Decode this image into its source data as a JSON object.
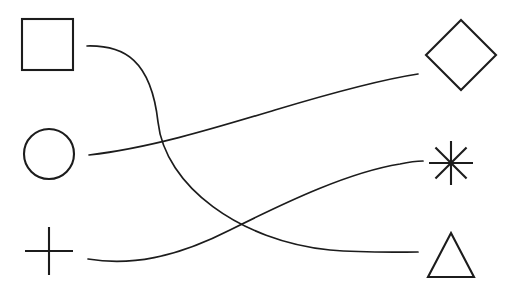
{
  "canvas": {
    "width": 515,
    "height": 287,
    "background_color": "#ffffff",
    "stroke_color": "#1c1c1c",
    "title": "Shape matching diagram"
  },
  "left_column": {
    "label": "left-shapes",
    "items": [
      {
        "id": "square",
        "name": "square",
        "icon": "square-icon",
        "center": [
          48,
          45
        ],
        "size": 51,
        "bbox": [
          22,
          19,
          51,
          51
        ]
      },
      {
        "id": "circle",
        "name": "circle",
        "icon": "circle-icon",
        "center": [
          49,
          154
        ],
        "radius": 25,
        "bbox": [
          24,
          129,
          50,
          50
        ]
      },
      {
        "id": "plus",
        "name": "plus",
        "icon": "plus-icon",
        "center": [
          49,
          251
        ],
        "arm": 24,
        "bbox": [
          25,
          227,
          48,
          48
        ]
      }
    ]
  },
  "right_column": {
    "label": "right-shapes",
    "items": [
      {
        "id": "diamond",
        "name": "diamond",
        "icon": "diamond-icon",
        "center": [
          461,
          55
        ],
        "radius": 35,
        "bbox": [
          426,
          20,
          70,
          70
        ]
      },
      {
        "id": "asterisk",
        "name": "asterisk",
        "icon": "asterisk-icon",
        "center": [
          451,
          163
        ],
        "radius": 22,
        "rays": 8,
        "bbox": [
          429,
          141,
          44,
          44
        ]
      },
      {
        "id": "triangle",
        "name": "triangle",
        "icon": "triangle-icon",
        "apex": [
          451,
          233
        ],
        "base_left": [
          428,
          277
        ],
        "base_right": [
          474,
          277
        ],
        "bbox": [
          428,
          233,
          46,
          44
        ]
      }
    ]
  },
  "connectors": {
    "label": "curved-connectors",
    "count": 3,
    "items": [
      {
        "id": "square-to-triangle",
        "name": "connector-square-triangle",
        "from": "square",
        "to": "triangle",
        "start": [
          87,
          46
        ],
        "end": [
          418,
          252
        ],
        "path": "M 87 46 C 124 45 151 60 158 122 C 165 186 240 241 330 250 C 365 253 398 252 418 252"
      },
      {
        "id": "circle-to-diamond",
        "name": "connector-circle-diamond",
        "from": "circle",
        "to": "diamond",
        "start": [
          89,
          155
        ],
        "end": [
          418,
          74
        ],
        "path": "M 89 155 C 150 148 215 128 275 110 C 335 92 385 79 418 74"
      },
      {
        "id": "plus-to-asterisk",
        "name": "connector-plus-asterisk",
        "from": "plus",
        "to": "asterisk",
        "start": [
          88,
          259
        ],
        "end": [
          423,
          161
        ],
        "path": "M 88 259 C 130 266 175 258 230 230 C 290 200 350 172 400 164 C 409 162 417 161 423 161"
      }
    ],
    "crossings": [
      {
        "name": "crossing-upper",
        "point": [
          160,
          143
        ]
      },
      {
        "name": "crossing-lower",
        "point": [
          232,
          213
        ]
      }
    ]
  }
}
